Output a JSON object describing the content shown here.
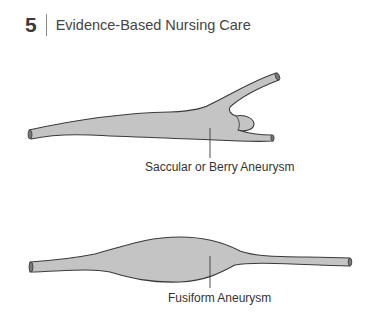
{
  "header": {
    "chapter_number": "5",
    "chapter_title": "Evidence-Based Nursing Care"
  },
  "figure": {
    "diagrams": [
      {
        "name": "saccular",
        "label": "Saccular or Berry Aneurysm"
      },
      {
        "name": "fusiform",
        "label": "Fusiform Aneurysm"
      }
    ],
    "colors": {
      "fill": "#c4c4c4",
      "stroke": "#3a3a3a"
    }
  }
}
